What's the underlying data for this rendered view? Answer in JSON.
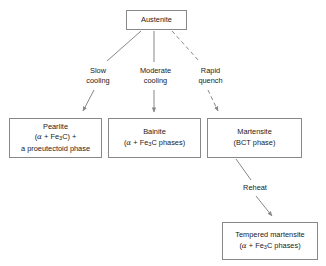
{
  "diagram": {
    "stroke_color": "#888888",
    "text_color": "#1a1a1a",
    "background": "#ffffff",
    "nodes": [
      {
        "id": "austenite",
        "lines": [
          "Austenite"
        ]
      },
      {
        "id": "pearlite",
        "line1": "Pearlite",
        "line2_pre": "(",
        "line2_alpha": "α",
        "line2_mid": " + Fe",
        "line2_sub": "3",
        "line2_post": "C) +",
        "line3": "a proeutectoid phase"
      },
      {
        "id": "bainite",
        "line1": "Bainite",
        "line2_pre": "(",
        "line2_alpha": "α",
        "line2_mid": " + Fe",
        "line2_sub": "3",
        "line2_post": "C phases)"
      },
      {
        "id": "martensite",
        "line1": "Martensite",
        "line2": "(BCT phase)"
      },
      {
        "id": "tempered",
        "line1": "Tempered martensite",
        "line2_pre": "(",
        "line2_alpha": "α",
        "line2_mid": " + Fe",
        "line2_sub": "3",
        "line2_post": "C phases)"
      }
    ],
    "edges": [
      {
        "id": "slow-cooling",
        "from": "austenite",
        "to": "pearlite",
        "style": "solid",
        "label_line1": "Slow",
        "label_line2": "cooling"
      },
      {
        "id": "moderate-cooling",
        "from": "austenite",
        "to": "bainite",
        "style": "solid",
        "label_line1": "Moderate",
        "label_line2": "cooling"
      },
      {
        "id": "rapid-quench",
        "from": "austenite",
        "to": "martensite",
        "style": "dashed",
        "label_line1": "Rapid",
        "label_line2": "quench"
      },
      {
        "id": "reheat",
        "from": "martensite",
        "to": "tempered",
        "style": "solid",
        "label_line1": "Reheat"
      }
    ]
  }
}
